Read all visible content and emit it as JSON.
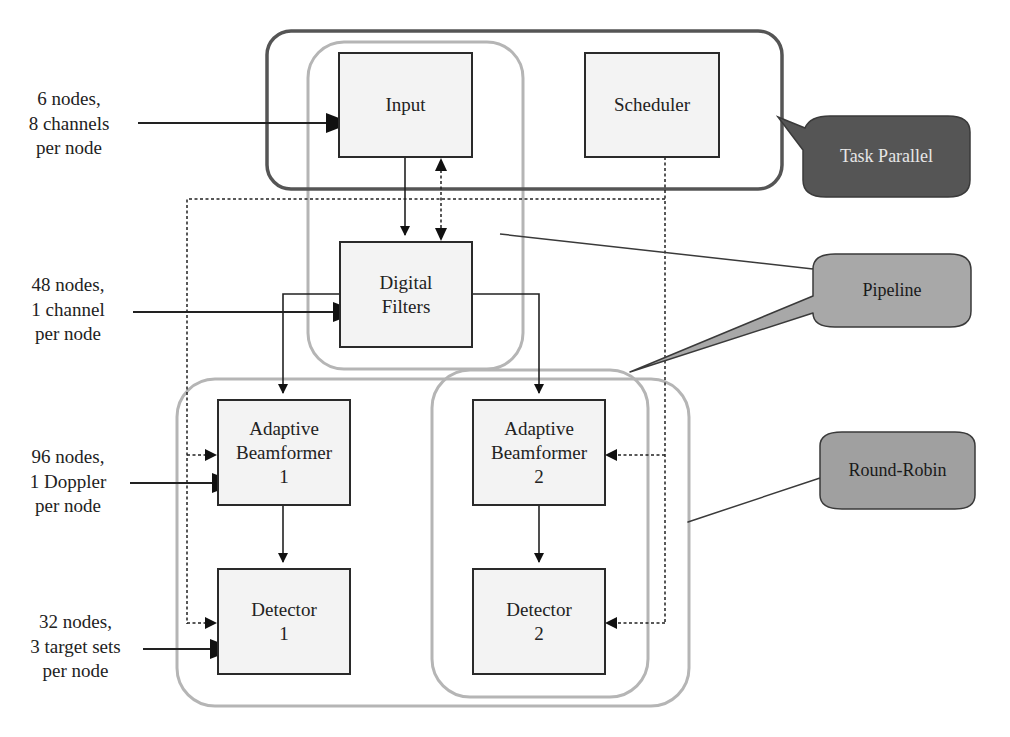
{
  "groups": {
    "task_parallel": {
      "label": "Task Parallel",
      "fill": "#555555",
      "text_color": "#e6e6e6",
      "border": "#555555"
    },
    "pipeline": {
      "label": "Pipeline",
      "fill": "#a8a8a8",
      "text_color": "#1a1a1a",
      "border": "#b5b5b5"
    },
    "round_robin": {
      "label": "Round-Robin",
      "fill": "#a0a0a0",
      "text_color": "#1a1a1a",
      "border": "#b5b5b5"
    }
  },
  "blocks": {
    "input": {
      "lines": [
        "Input"
      ]
    },
    "scheduler": {
      "lines": [
        "Scheduler"
      ]
    },
    "digital_filters": {
      "lines": [
        "Digital",
        "Filters"
      ]
    },
    "abf1": {
      "lines": [
        "Adaptive",
        "Beamformer",
        "1"
      ]
    },
    "abf2": {
      "lines": [
        "Adaptive",
        "Beamformer",
        "2"
      ]
    },
    "det1": {
      "lines": [
        "Detector",
        "1"
      ]
    },
    "det2": {
      "lines": [
        "Detector",
        "2"
      ]
    }
  },
  "side_labels": {
    "input": {
      "lines": [
        "6 nodes,",
        "8 channels",
        "per node"
      ]
    },
    "digital_filters": {
      "lines": [
        "48 nodes,",
        "1 channel",
        "per node"
      ]
    },
    "abf": {
      "lines": [
        "96 nodes,",
        "1 Doppler",
        "per node"
      ]
    },
    "detector": {
      "lines": [
        "32 nodes,",
        "3 target sets",
        "per node"
      ]
    }
  }
}
